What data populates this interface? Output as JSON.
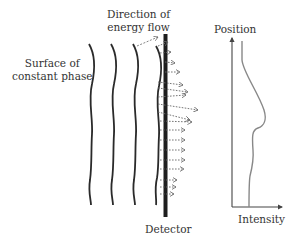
{
  "labels": {
    "surface": [
      "Surface of",
      "constant phase"
    ],
    "direction": [
      "Direction of",
      "energy flow"
    ],
    "detector": "Detector",
    "position": "Position",
    "intensity": "Intensity"
  },
  "colors": {
    "wave": "#2a2a2a",
    "detector": "#1e1e1e",
    "arrow": "#666666",
    "axis": "#444444",
    "curve": "#888888"
  }
}
